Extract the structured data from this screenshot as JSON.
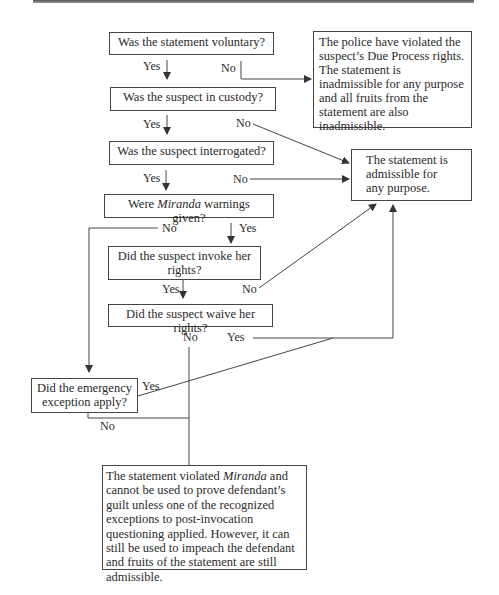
{
  "nodes": {
    "voluntary": "Was the statement voluntary?",
    "due_process": "The police have violated the suspect’s Due Process rights. The statement is inadmissible for any purpose and all fruits from the statement are also inadmissible.",
    "custody": "Was the suspect in custody?",
    "interrogated": "Was the suspect interrogated?",
    "admissible": "The statement is admissible for any purpose.",
    "miranda_pre": "Were ",
    "miranda_em": "Miranda",
    "miranda_post": " warnings given?",
    "invoke": "Did the suspect invoke her rights?",
    "waive": "Did the suspect waive her rights?",
    "emergency": "Did the emergency exception apply?",
    "violated_pre": "The statement violated ",
    "violated_em": "Miranda",
    "violated_post": " and cannot be used to prove defendant’s guilt unless one of the recognized exceptions to post-invocation questioning applied. However, it can still be used to impeach the defendant and fruits of the statement are still admissible."
  },
  "labels": {
    "yes": "Yes",
    "no": "No"
  }
}
